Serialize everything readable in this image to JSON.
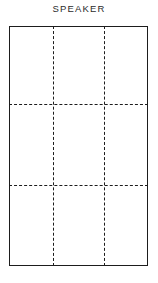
{
  "page": {
    "background_color": "#ffffff",
    "width": 158,
    "height": 283
  },
  "title": {
    "text": "SPEAKER",
    "color": "#2b2b2b"
  },
  "diagram": {
    "kind": "panel-fold-layout",
    "line_color": "#1d1d1d",
    "outline": {
      "label": "speaker-panel-outline",
      "x": 9,
      "y": 26,
      "width": 139,
      "height": 240,
      "style": "solid"
    },
    "fold_lines": {
      "style": "dashed",
      "vertical": [
        {
          "label": "vertical-fold-left",
          "x": 53
        },
        {
          "label": "vertical-fold-right",
          "x": 104
        }
      ],
      "horizontal": [
        {
          "label": "horizontal-fold-upper",
          "y": 104
        },
        {
          "label": "horizontal-fold-lower",
          "y": 185
        }
      ]
    },
    "grid": {
      "columns": 3,
      "rows": 3,
      "cells": [
        {
          "label": "cell-r1c1",
          "row": 1,
          "col": 1
        },
        {
          "label": "cell-r1c2",
          "row": 1,
          "col": 2
        },
        {
          "label": "cell-r1c3",
          "row": 1,
          "col": 3
        },
        {
          "label": "cell-r2c1",
          "row": 2,
          "col": 1
        },
        {
          "label": "cell-r2c2",
          "row": 2,
          "col": 2
        },
        {
          "label": "cell-r2c3",
          "row": 2,
          "col": 3
        },
        {
          "label": "cell-r3c1",
          "row": 3,
          "col": 1
        },
        {
          "label": "cell-r3c2",
          "row": 3,
          "col": 2
        },
        {
          "label": "cell-r3c3",
          "row": 3,
          "col": 3
        }
      ]
    }
  }
}
